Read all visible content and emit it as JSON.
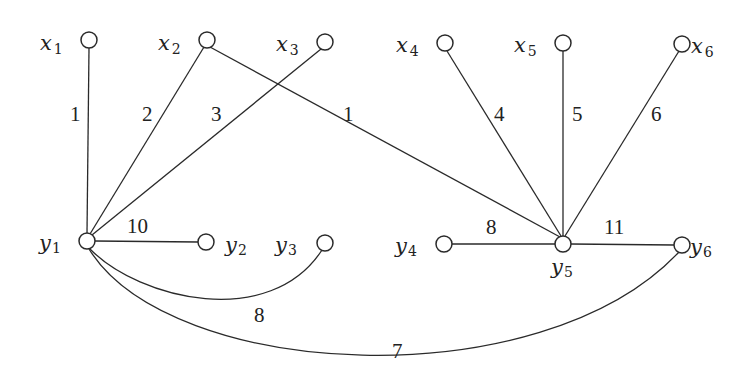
{
  "diagram": {
    "type": "weighted bipartite graph",
    "nodes": [
      {
        "id": "x1",
        "name": "x",
        "sub": "1",
        "cx": 89,
        "cy": 40
      },
      {
        "id": "x2",
        "name": "x",
        "sub": "2",
        "cx": 207,
        "cy": 40
      },
      {
        "id": "x3",
        "name": "x",
        "sub": "3",
        "cx": 325,
        "cy": 42
      },
      {
        "id": "x4",
        "name": "x",
        "sub": "4",
        "cx": 445,
        "cy": 43
      },
      {
        "id": "x5",
        "name": "x",
        "sub": "5",
        "cx": 563,
        "cy": 43
      },
      {
        "id": "x6",
        "name": "x",
        "sub": "6",
        "cx": 682,
        "cy": 44
      },
      {
        "id": "y1",
        "name": "y",
        "sub": "1",
        "cx": 87,
        "cy": 241
      },
      {
        "id": "y2",
        "name": "y",
        "sub": "2",
        "cx": 206,
        "cy": 242
      },
      {
        "id": "y3",
        "name": "y",
        "sub": "3",
        "cx": 325,
        "cy": 243
      },
      {
        "id": "y4",
        "name": "y",
        "sub": "4",
        "cx": 444,
        "cy": 244
      },
      {
        "id": "y5",
        "name": "y",
        "sub": "5",
        "cx": 563,
        "cy": 244
      },
      {
        "id": "y6",
        "name": "y",
        "sub": "6",
        "cx": 682,
        "cy": 245
      }
    ],
    "edges": [
      {
        "from": "x1",
        "to": "y1",
        "weight": "1"
      },
      {
        "from": "x2",
        "to": "y1",
        "weight": "2"
      },
      {
        "from": "x3",
        "to": "y1",
        "weight": "3"
      },
      {
        "from": "x2",
        "to": "y5",
        "weight": "1"
      },
      {
        "from": "x4",
        "to": "y5",
        "weight": "4"
      },
      {
        "from": "x5",
        "to": "y5",
        "weight": "5"
      },
      {
        "from": "x6",
        "to": "y5",
        "weight": "6"
      },
      {
        "from": "y1",
        "to": "y2",
        "weight": "10"
      },
      {
        "from": "y4",
        "to": "y5",
        "weight": "8"
      },
      {
        "from": "y5",
        "to": "y6",
        "weight": "11"
      },
      {
        "from": "y1",
        "to": "y3",
        "weight": "8",
        "curved": true
      },
      {
        "from": "y1",
        "to": "y6",
        "weight": "7",
        "curved": true
      }
    ]
  }
}
